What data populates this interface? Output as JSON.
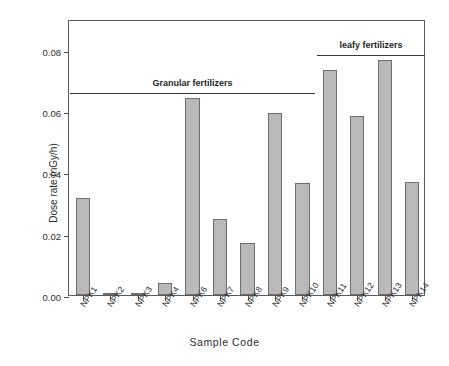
{
  "chart_data": {
    "type": "bar",
    "title": "",
    "xlabel": "Sample Code",
    "ylabel": "Dose rate (nGy/h)",
    "categories": [
      "NPK1",
      "NPK2",
      "NPK3",
      "NPK4",
      "NPK6",
      "NPK7",
      "NPK8",
      "NPK9",
      "NPK10",
      "NPK11",
      "NPK12",
      "NPK13",
      "NPK14"
    ],
    "values": [
      0.0315,
      0.0004,
      0.0004,
      0.004,
      0.0642,
      0.0248,
      0.017,
      0.0592,
      0.0365,
      0.0734,
      0.0585,
      0.0767,
      0.0367
    ],
    "ylim": [
      0.0,
      0.09
    ],
    "yticks": [
      0.0,
      0.02,
      0.04,
      0.06,
      0.08
    ],
    "ytick_labels": [
      "0.00",
      "0.02",
      "0.04",
      "0.06",
      "0.08"
    ],
    "grid": false,
    "legend": "none",
    "bar_color": "#b9b9b9",
    "bar_edge_color": "#6e6e6e",
    "annotations": [
      {
        "label": "Granular fertilizers",
        "span_start": "NPK1",
        "span_end": "NPK10",
        "rule_y_value": 0.0665
      },
      {
        "label": "leafy fertilizers",
        "span_start": "NPK11",
        "span_end": "NPK14",
        "rule_y_value": 0.079
      }
    ]
  }
}
